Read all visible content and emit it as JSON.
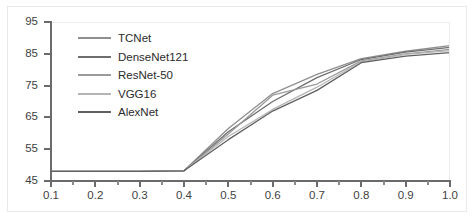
{
  "chart_data": {
    "type": "line",
    "title": "",
    "xlabel": "",
    "ylabel": "",
    "xlim": [
      0.1,
      1.0
    ],
    "ylim": [
      45,
      95
    ],
    "grid": false,
    "legend_position": "inside-top-left",
    "x_ticks": [
      "0.1",
      "0.2",
      "0.3",
      "0.4",
      "0.5",
      "0.6",
      "0.7",
      "0.8",
      "0.9",
      "1.0"
    ],
    "y_ticks": [
      "45",
      "55",
      "65",
      "75",
      "85",
      "95"
    ],
    "x": [
      0.1,
      0.2,
      0.3,
      0.4,
      0.5,
      0.6,
      0.7,
      0.8,
      0.9,
      1.0
    ],
    "series": [
      {
        "name": "TCNet",
        "color": "#8f8f8f",
        "values": [
          48.0,
          48.0,
          48.0,
          48.2,
          61.5,
          72.5,
          78.5,
          83.5,
          85.8,
          87.6
        ]
      },
      {
        "name": "DenseNet121",
        "color": "#6e6e6e",
        "values": [
          48.0,
          48.0,
          48.0,
          48.2,
          60.5,
          70.0,
          77.5,
          83.2,
          85.5,
          87.0
        ]
      },
      {
        "name": "ResNet-50",
        "color": "#9a9a9a",
        "values": [
          48.0,
          48.0,
          48.0,
          48.2,
          59.8,
          72.0,
          75.5,
          82.8,
          85.0,
          86.4
        ]
      },
      {
        "name": "VGG16",
        "color": "#b5b5b5",
        "values": [
          48.0,
          48.0,
          48.0,
          48.2,
          59.0,
          67.5,
          74.5,
          82.5,
          84.8,
          86.0
        ]
      },
      {
        "name": "AlexNet",
        "color": "#606060",
        "values": [
          48.0,
          48.0,
          48.0,
          48.2,
          58.0,
          67.0,
          73.5,
          82.2,
          84.3,
          85.4
        ]
      }
    ]
  }
}
